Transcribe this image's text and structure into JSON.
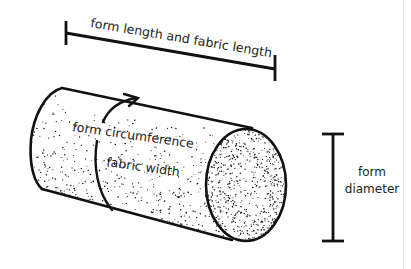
{
  "diagram": {
    "labels": {
      "length": "form length and fabric length",
      "circumference": "form circumference",
      "width": "fabric width",
      "diameter_line1": "form",
      "diameter_line2": "diameter"
    },
    "colors": {
      "ink": "#111111",
      "text": "#222222",
      "background": "#ffffff"
    }
  }
}
